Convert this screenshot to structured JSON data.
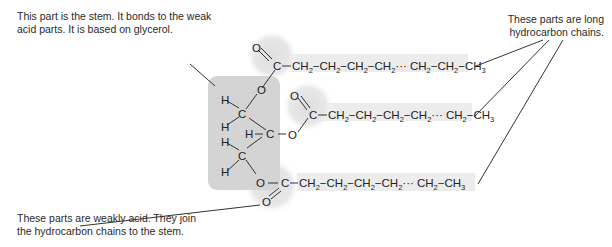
{
  "labels": {
    "stem": [
      "This part is the stem. It bonds to the weak",
      "acid parts. It is based on glycerol."
    ],
    "chains": [
      "These parts are long",
      "hydrocarbon chains."
    ],
    "acid": [
      "These parts are weakly acid. They join",
      "the hydrocarbon chains to the stem."
    ]
  },
  "molecule": {
    "glycerol_atoms": [
      "H",
      "H",
      "C",
      "H",
      "C",
      "H",
      "H",
      "C",
      "H"
    ],
    "ester_atoms": [
      "O",
      "C",
      "O"
    ],
    "chains": [
      "CH2 — CH2 — CH2 — CH2 ··· CH2 — CH2 — CH3",
      "CH2 — CH2 — CH2 — CH2 ··· CH2 — CH3",
      "CH2 — CH2 — CH2 — CH2 ··· CH2 — CH3"
    ]
  },
  "colors": {
    "stem_shade": "#d4d4d4",
    "chain_shade": "#ececec",
    "ester_glow": "#e4e4e4",
    "line": "#333333"
  }
}
